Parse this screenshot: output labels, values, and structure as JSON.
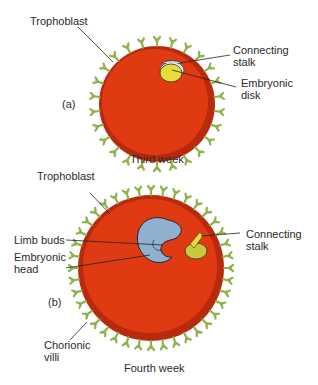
{
  "figure_a": {
    "panel": "(a)",
    "caption": "Third week",
    "labels": {
      "trophoblast": "Trophoblast",
      "connecting_stalk": "Connecting\nstalk",
      "embryonic_disk": "Embryonic\ndisk"
    }
  },
  "figure_b": {
    "panel": "(b)",
    "caption": "Fourth week",
    "labels": {
      "trophoblast": "Trophoblast",
      "limb_buds": "Limb buds",
      "embryonic_head": "Embryonic\nhead",
      "connecting_stalk": "Connecting\nstalk",
      "chorionic_villi": "Chorionic\nvilli"
    }
  },
  "colors": {
    "chorion_red": "#e03a12",
    "chorion_rim": "#c42e0e",
    "villi_green": "#8fb24a",
    "villi_outline": "#4d6a22",
    "embryo_blue": "#8fb1cf",
    "yolk_yellow": "#d6d23a"
  }
}
